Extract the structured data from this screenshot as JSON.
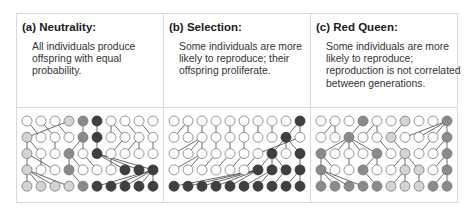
{
  "panels": [
    {
      "id": "a",
      "title": "(a) Neutrality:",
      "description": "All individuals produce offspring with equal probability.",
      "grid": [
        [
          "W",
          "W",
          "W",
          "L",
          "M",
          "D",
          "W",
          "W",
          "W",
          "W"
        ],
        [
          "L",
          "W",
          "W",
          "W",
          "M",
          "D",
          "W",
          "W",
          "W",
          "W"
        ],
        [
          "L",
          "W",
          "W",
          "M",
          "W",
          "D",
          "W",
          "W",
          "W",
          "W"
        ],
        [
          "L",
          "W",
          "W",
          "M",
          "W",
          "W",
          "W",
          "D",
          "D",
          "D"
        ],
        [
          "L",
          "L",
          "L",
          "L",
          "M",
          "D",
          "D",
          "D",
          "D",
          "D"
        ]
      ],
      "parents": [
        null,
        [
          3,
          0,
          1,
          2,
          4,
          5,
          6,
          6,
          7,
          8
        ],
        [
          0,
          0,
          2,
          4,
          4,
          5,
          7,
          8,
          8,
          9
        ],
        [
          0,
          1,
          0,
          3,
          3,
          4,
          6,
          5,
          5,
          5
        ],
        [
          0,
          0,
          0,
          0,
          3,
          9,
          9,
          9,
          9,
          9
        ]
      ]
    },
    {
      "id": "b",
      "title": "(b) Selection:",
      "description": "Some individuals are more likely to reproduce; their offspring proliferate.",
      "grid": [
        [
          "W",
          "W",
          "W",
          "W",
          "W",
          "W",
          "W",
          "W",
          "W",
          "D"
        ],
        [
          "W",
          "W",
          "W",
          "W",
          "W",
          "W",
          "W",
          "W",
          "D",
          "W"
        ],
        [
          "W",
          "W",
          "W",
          "W",
          "W",
          "W",
          "W",
          "D",
          "W",
          "D"
        ],
        [
          "W",
          "W",
          "W",
          "W",
          "W",
          "W",
          "D",
          "D",
          "D",
          "D"
        ],
        [
          "D",
          "D",
          "D",
          "D",
          "D",
          "D",
          "D",
          "D",
          "D",
          "D"
        ]
      ],
      "parents": [
        null,
        [
          1,
          1,
          2,
          3,
          4,
          5,
          6,
          7,
          9,
          9
        ],
        [
          2,
          2,
          2,
          3,
          4,
          5,
          9,
          8,
          8,
          8
        ],
        [
          2,
          2,
          3,
          4,
          5,
          6,
          7,
          7,
          7,
          9
        ],
        [
          6,
          6,
          6,
          6,
          6,
          7,
          7,
          8,
          9,
          9
        ]
      ]
    },
    {
      "id": "c",
      "title": "(c) Red Queen:",
      "description": "Some individuals are more likely to reproduce; reproduction is not correlated between generations.",
      "grid": [
        [
          "W",
          "W",
          "W",
          "M",
          "W",
          "W",
          "L",
          "W",
          "W",
          "M"
        ],
        [
          "W",
          "W",
          "M",
          "W",
          "W",
          "L",
          "W",
          "W",
          "W",
          "M"
        ],
        [
          "M",
          "W",
          "W",
          "W",
          "M",
          "W",
          "L",
          "W",
          "W",
          "M"
        ],
        [
          "M",
          "W",
          "W",
          "M",
          "W",
          "W",
          "L",
          "L",
          "W",
          "M"
        ],
        [
          "M",
          "M",
          "M",
          "M",
          "M",
          "L",
          "L",
          "L",
          "M",
          "M"
        ]
      ],
      "parents": [
        null,
        [
          1,
          1,
          3,
          4,
          4,
          6,
          9,
          9,
          9,
          9
        ],
        [
          2,
          2,
          2,
          2,
          2,
          4,
          5,
          8,
          9,
          9
        ],
        [
          0,
          0,
          2,
          4,
          4,
          6,
          6,
          6,
          9,
          9
        ],
        [
          0,
          0,
          0,
          0,
          3,
          6,
          6,
          7,
          9,
          9
        ]
      ]
    }
  ],
  "colors": {
    "W": "#ffffff",
    "L": "#d4d4d4",
    "M": "#8a8a8a",
    "D": "#3f3f3f",
    "stroke": "#7a7a7a",
    "line": "#444444",
    "border": "#d9d9d9"
  }
}
